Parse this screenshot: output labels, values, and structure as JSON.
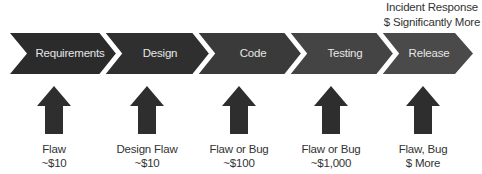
{
  "diagram": {
    "top_annotation": {
      "line1": "Incident Response",
      "line2": "$ Significantly More"
    },
    "stages": [
      {
        "label": "Requirements",
        "color": "#2b2b2b",
        "cost_line1": "Flaw",
        "cost_line2": "~$10"
      },
      {
        "label": "Design",
        "color": "#2f2f2f",
        "cost_line1": "Design Flaw",
        "cost_line2": "~$10"
      },
      {
        "label": "Code",
        "color": "#3a3a3a",
        "cost_line1": "Flaw or Bug",
        "cost_line2": "~$100"
      },
      {
        "label": "Testing",
        "color": "#444444",
        "cost_line1": "Flaw or Bug",
        "cost_line2": "~$1,000"
      },
      {
        "label": "Release",
        "color": "#4a4a4a",
        "cost_line1": "Flaw, Bug",
        "cost_line2": "$ More"
      }
    ],
    "arrow_color": "#2e2e2e"
  }
}
